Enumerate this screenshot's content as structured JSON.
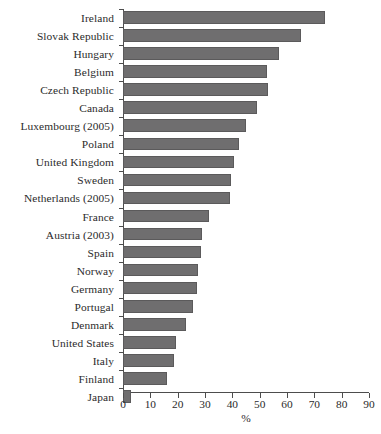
{
  "chart_data": {
    "type": "bar",
    "orientation": "horizontal",
    "title": "",
    "subtitle": "",
    "xlabel": "%",
    "ylabel": "",
    "xlim": [
      0,
      90
    ],
    "xticks": [
      0,
      10,
      20,
      30,
      40,
      50,
      60,
      70,
      80,
      90
    ],
    "xtick_labels": [
      "0",
      "10",
      "20",
      "30",
      "40",
      "50",
      "60",
      "70",
      "80",
      "90"
    ],
    "grid": false,
    "legend": null,
    "bar_color": "#6f6e6f",
    "bar_edge_color": "#5b5a5b",
    "axis_color": "#4d4d4d",
    "categories": [
      "Ireland",
      "Slovak Republic",
      "Hungary",
      "Belgium",
      "Czech Republic",
      "Canada",
      "Luxembourg (2005)",
      "Poland",
      "United Kingdom",
      "Sweden",
      "Netherlands (2005)",
      "France",
      "Austria (2003)",
      "Spain",
      "Norway",
      "Germany",
      "Portugal",
      "Denmark",
      "United States",
      "Italy",
      "Finland",
      "Japan"
    ],
    "values": [
      74,
      65,
      57,
      52.5,
      53,
      49,
      45,
      42.5,
      40.5,
      39.5,
      39,
      31.5,
      29,
      28.5,
      27.5,
      27,
      25.5,
      23,
      19.5,
      18.5,
      16,
      3
    ]
  }
}
